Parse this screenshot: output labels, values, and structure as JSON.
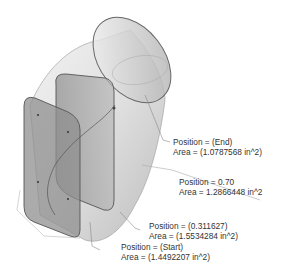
{
  "labels": [
    {
      "id": "end",
      "position": "Position = (End)",
      "area": "Area = (1.0787568 in^2)"
    },
    {
      "id": "p070",
      "position": "Position = 0.70",
      "area": "Area = 1.2866448 in^2"
    },
    {
      "id": "p0311627",
      "position": "Position = (0.311627)",
      "area": "Area = (1.5534284 in^2)"
    },
    {
      "id": "start",
      "position": "Position = (Start)",
      "area": "Area = (1.4492207 in^2)"
    }
  ]
}
